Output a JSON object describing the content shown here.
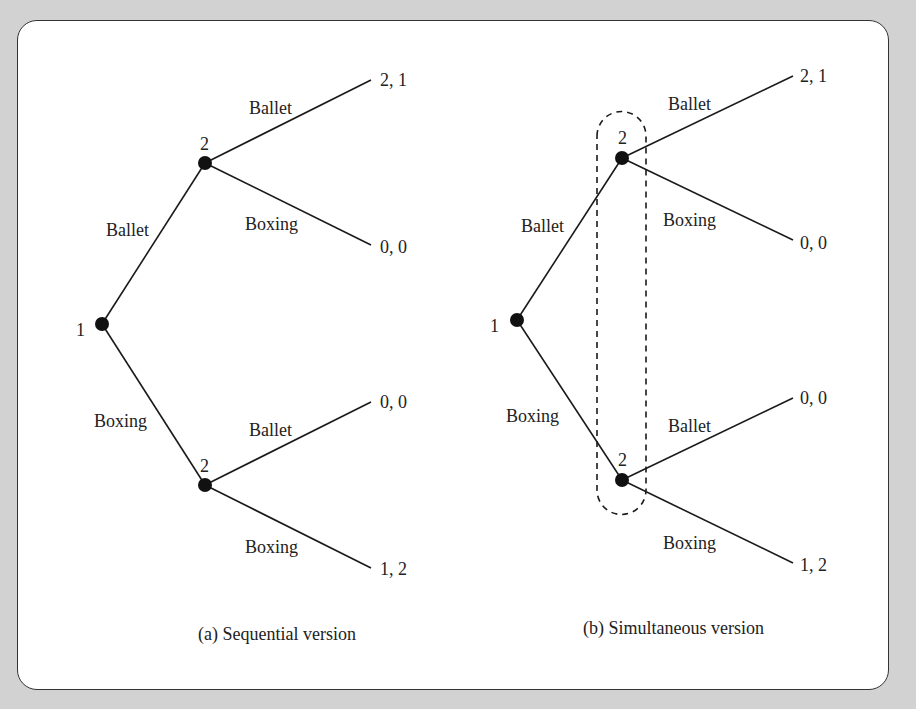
{
  "figure": {
    "panels": [
      {
        "id": "a",
        "caption": "(a) Sequential version",
        "root": {
          "player": "1"
        },
        "first_moves": [
          {
            "label": "Ballet",
            "node_player": "2"
          },
          {
            "label": "Boxing",
            "node_player": "2"
          }
        ],
        "second_moves": [
          {
            "label": "Ballet",
            "payoff": "2, 1"
          },
          {
            "label": "Boxing",
            "payoff": "0, 0"
          },
          {
            "label": "Ballet",
            "payoff": "0, 0"
          },
          {
            "label": "Boxing",
            "payoff": "1, 2"
          }
        ],
        "information_set": false
      },
      {
        "id": "b",
        "caption": "(b) Simultaneous version",
        "root": {
          "player": "1"
        },
        "first_moves": [
          {
            "label": "Ballet",
            "node_player": "2"
          },
          {
            "label": "Boxing",
            "node_player": "2"
          }
        ],
        "second_moves": [
          {
            "label": "Ballet",
            "payoff": "2, 1"
          },
          {
            "label": "Boxing",
            "payoff": "0, 0"
          },
          {
            "label": "Ballet",
            "payoff": "0, 0"
          },
          {
            "label": "Boxing",
            "payoff": "1, 2"
          }
        ],
        "information_set": true
      }
    ]
  }
}
